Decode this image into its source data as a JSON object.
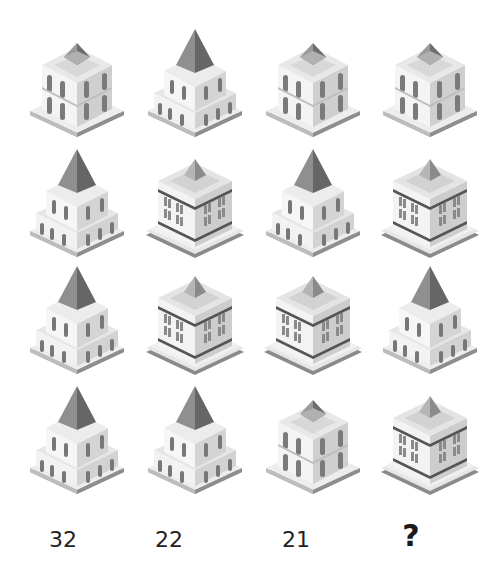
{
  "puzzle": {
    "columns": 4,
    "rows": 4,
    "grid": [
      [
        "arch-2story",
        "pyramid-tower",
        "arch-2story",
        "arch-2story"
      ],
      [
        "pyramid-tower",
        "office-block",
        "pyramid-tower",
        "office-block"
      ],
      [
        "pyramid-tower",
        "office-block",
        "office-block",
        "pyramid-tower"
      ],
      [
        "pyramid-tower",
        "pyramid-tower",
        "arch-2story",
        "office-block"
      ]
    ],
    "labels": [
      "32",
      "22",
      "21",
      "?"
    ]
  },
  "colors": {
    "background": "#ffffff",
    "label_text": "#222222",
    "building_light": "#f2f2f2",
    "building_mid": "#d6d6d6",
    "building_dark": "#8c8c8c",
    "roof_dark": "#6e6e6e"
  }
}
